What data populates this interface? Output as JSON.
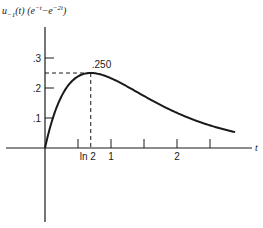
{
  "chart_data": {
    "type": "line",
    "title_parts": {
      "main": "u",
      "sub": "−1",
      "mid": "(t) (e",
      "sup1": "−t",
      "minus": "−e",
      "sup2": "−2t",
      "end": ")"
    },
    "xlabel": "t",
    "ylabel": "",
    "xlim": [
      0,
      3.1
    ],
    "ylim": [
      0,
      0.35
    ],
    "x_ticks": [
      0.5,
      0.6931,
      1,
      1.5,
      2,
      2.5
    ],
    "x_tick_labels": [
      {
        "value": 0.6931,
        "label": "ln 2"
      },
      {
        "value": 1,
        "label": "1"
      },
      {
        "value": 2,
        "label": "2"
      }
    ],
    "y_ticks": [
      0.1,
      0.2,
      0.3
    ],
    "y_tick_labels": [
      {
        "value": 0.1,
        "label": ".1"
      },
      {
        "value": 0.2,
        "label": ".2"
      },
      {
        "value": 0.3,
        "label": ".3"
      }
    ],
    "annotations": [
      {
        "x": 0.6931,
        "y": 0.25,
        "label": ".250",
        "note": "peak, dashed guide lines to axes"
      }
    ],
    "series": [
      {
        "name": "u_-1(t)(e^-t - e^-2t)",
        "x": [
          0,
          0.1,
          0.2,
          0.3,
          0.4,
          0.5,
          0.6931,
          0.8,
          1.0,
          1.25,
          1.5,
          1.75,
          2.0,
          2.25,
          2.5,
          2.75,
          2.88
        ],
        "values": [
          0,
          0.086,
          0.148,
          0.192,
          0.221,
          0.239,
          0.25,
          0.248,
          0.233,
          0.205,
          0.173,
          0.144,
          0.117,
          0.094,
          0.075,
          0.06,
          0.053
        ]
      }
    ],
    "grid": false,
    "legend": null
  }
}
